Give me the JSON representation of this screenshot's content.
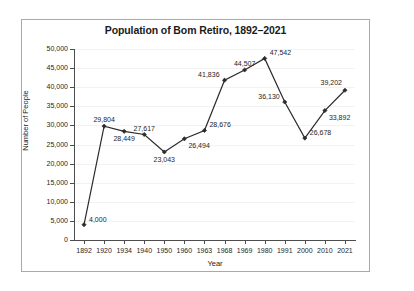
{
  "chart_data": {
    "type": "line",
    "title": "Population of Bom Retiro, 1892–2021",
    "xlabel": "Year",
    "ylabel": "Number of People",
    "categories": [
      "1892",
      "1920",
      "1934",
      "1940",
      "1950",
      "1960",
      "1963",
      "1968",
      "1969",
      "1980",
      "1991",
      "2000",
      "2010",
      "2021"
    ],
    "values": [
      4000,
      29804,
      28449,
      27617,
      23043,
      26494,
      28676,
      41836,
      44507,
      47542,
      36130,
      26678,
      33892,
      39202
    ],
    "value_labels": [
      "4,000",
      "29,804",
      "28,449",
      "27,617",
      "23,043",
      "26,494",
      "28,676",
      "41,836",
      "44,507",
      "47,542",
      "36,130",
      "26,678",
      "33,892",
      "39,202"
    ],
    "label_positions": [
      "right",
      "above",
      "below",
      "above",
      "below",
      "below-right",
      "right",
      "left",
      "above",
      "right",
      "left",
      "right",
      "below-right",
      "above-left"
    ],
    "ylim": [
      0,
      50000
    ],
    "yticks": [
      0,
      5000,
      10000,
      15000,
      20000,
      25000,
      30000,
      35000,
      40000,
      45000,
      50000
    ],
    "ytick_labels": [
      "0",
      "5,000",
      "10,000",
      "15,000",
      "20,000",
      "25,000",
      "30,000",
      "35,000",
      "40,000",
      "45,000",
      "50,000"
    ],
    "grid": true,
    "legend": false,
    "line_color": "#2b2b2b",
    "marker": "diamond",
    "marker_color": "#2b2b2b"
  }
}
